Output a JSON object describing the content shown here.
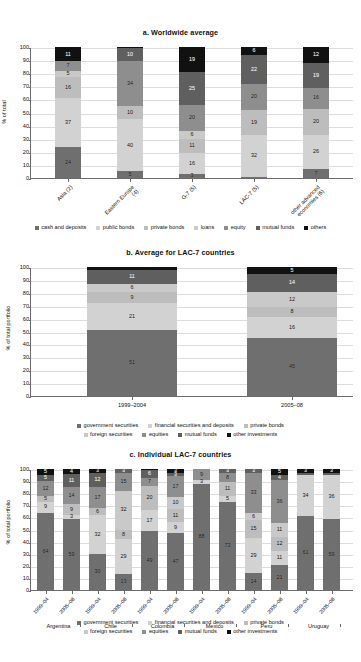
{
  "colors": {
    "government_securities": "#6f6f6f",
    "financial_securities_and_deposits": "#d2d2d2",
    "private_bonds": "#bdbdbd",
    "foreign_securities": "#c9c9c9",
    "equities": "#8e8e8e",
    "mutual_funds": "#5f5f5f",
    "other_investments": "#111111",
    "cash_and_deposits": "#6f6f6f",
    "public_bonds": "#d2d2d2",
    "loans": "#c9c9c9",
    "equity": "#8e8e8e",
    "others": "#111111",
    "axis": "#6b6b6b",
    "grid": "#dcdcdc",
    "background": "#ffffff"
  },
  "chart_data": [
    {
      "id": "a",
      "type": "bar",
      "stacked": true,
      "title": "a. Worldwide average",
      "xlabel": "",
      "ylabel": "% of total",
      "ylim": [
        0,
        100
      ],
      "yticks": [
        0,
        10,
        20,
        30,
        40,
        50,
        60,
        70,
        80,
        90,
        100
      ],
      "grid": true,
      "legend_position": "bottom",
      "categories": [
        "Asia (2)",
        "Eastern Europe (4)",
        "G-7 (5)",
        "LAC-7 (5)",
        "other advanced economies (6)"
      ],
      "series": [
        {
          "name": "cash and deposits",
          "color": "#6f6f6f",
          "values": [
            24,
            5,
            3,
            1,
            7
          ]
        },
        {
          "name": "public bonds",
          "color": "#d2d2d2",
          "values": [
            37,
            40,
            16,
            32,
            26
          ]
        },
        {
          "name": "private bonds",
          "color": "#bdbdbd",
          "values": [
            16,
            10,
            11,
            19,
            20
          ]
        },
        {
          "name": "loans",
          "color": "#c9c9c9",
          "values": [
            5,
            0,
            6,
            0,
            0
          ]
        },
        {
          "name": "equity",
          "color": "#8e8e8e",
          "values": [
            7,
            34,
            20,
            20,
            16
          ]
        },
        {
          "name": "mutual funds",
          "color": "#5f5f5f",
          "values": [
            0,
            10,
            25,
            22,
            19
          ]
        },
        {
          "name": "others",
          "color": "#111111",
          "values": [
            11,
            1,
            19,
            6,
            12
          ]
        }
      ]
    },
    {
      "id": "b",
      "type": "bar",
      "stacked": true,
      "title": "b. Average for LAC-7 countries",
      "xlabel": "",
      "ylabel": "% of total portfolio",
      "ylim": [
        0,
        100
      ],
      "yticks": [
        0,
        10,
        20,
        30,
        40,
        50,
        60,
        70,
        80,
        90,
        100
      ],
      "grid": true,
      "legend_position": "bottom",
      "categories": [
        "1999–2004",
        "2005–08"
      ],
      "series": [
        {
          "name": "government securities",
          "color": "#6f6f6f",
          "values": [
            51,
            45
          ]
        },
        {
          "name": "financial securities and deposits",
          "color": "#d2d2d2",
          "values": [
            21,
            16
          ]
        },
        {
          "name": "private bonds",
          "color": "#bdbdbd",
          "values": [
            9,
            8
          ]
        },
        {
          "name": "foreign securities",
          "color": "#c9c9c9",
          "values": [
            6,
            12
          ]
        },
        {
          "name": "equities",
          "color": "#8e8e8e",
          "values": [
            0,
            0
          ]
        },
        {
          "name": "mutual funds",
          "color": "#5f5f5f",
          "values": [
            11,
            14
          ]
        },
        {
          "name": "other investments",
          "color": "#111111",
          "values": [
            2,
            5
          ]
        }
      ]
    },
    {
      "id": "c",
      "type": "bar",
      "stacked": true,
      "title": "c. Individual LAC-7 countries",
      "xlabel": "",
      "ylabel": "% of total portfolio",
      "ylim": [
        0,
        100
      ],
      "yticks": [
        0,
        10,
        20,
        30,
        40,
        50,
        60,
        70,
        80,
        90,
        100
      ],
      "grid": true,
      "legend_position": "bottom",
      "countries": [
        "Argentina",
        "Chile",
        "Colombia",
        "Mexico",
        "Peru",
        "Uruguay"
      ],
      "categories": [
        "1999–04",
        "2005–08",
        "1999–04",
        "2005–08",
        "1999–04",
        "2005–08",
        "1999–04",
        "2005–08",
        "1999–04",
        "2005–08",
        "1999–04",
        "2005–08"
      ],
      "series": [
        {
          "name": "government securities",
          "color": "#6f6f6f",
          "values": [
            64,
            59,
            30,
            13,
            49,
            47,
            88,
            73,
            14,
            21,
            61,
            59
          ]
        },
        {
          "name": "financial securities and deposits",
          "color": "#d2d2d2",
          "values": [
            9,
            3,
            32,
            29,
            17,
            9,
            3,
            5,
            29,
            11,
            34,
            36
          ]
        },
        {
          "name": "private bonds",
          "color": "#bdbdbd",
          "values": [
            5,
            9,
            6,
            8,
            20,
            11,
            0,
            11,
            15,
            12,
            0,
            0
          ]
        },
        {
          "name": "foreign securities",
          "color": "#c9c9c9",
          "values": [
            0,
            0,
            0,
            32,
            0,
            10,
            0,
            0,
            6,
            11,
            0,
            0
          ]
        },
        {
          "name": "equities",
          "color": "#8e8e8e",
          "values": [
            12,
            14,
            17,
            15,
            7,
            17,
            9,
            8,
            33,
            36,
            0,
            0
          ]
        },
        {
          "name": "mutual funds",
          "color": "#5f5f5f",
          "values": [
            5,
            11,
            12,
            3,
            6,
            3,
            0,
            3,
            3,
            4,
            2,
            2
          ]
        },
        {
          "name": "other investments",
          "color": "#111111",
          "values": [
            5,
            4,
            3,
            0,
            1,
            3,
            0,
            0,
            0,
            5,
            3,
            3
          ]
        }
      ]
    }
  ]
}
